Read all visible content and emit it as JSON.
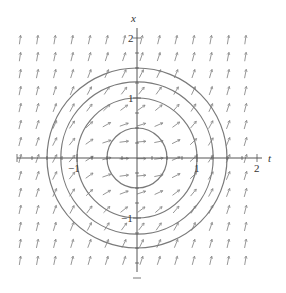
{
  "chart_data": {
    "type": "direction_field",
    "title": "",
    "equation_guess": "dx/dt = t^2 + x^2",
    "xlabel": "t",
    "ylabel": "x",
    "xlim": [
      -2,
      2
    ],
    "ylim": [
      -2,
      2
    ],
    "x_ticks": [
      -1,
      1,
      2
    ],
    "y_ticks": [
      2,
      1,
      -1
    ],
    "x_tick_labels": [
      "−1",
      "1",
      "2"
    ],
    "y_tick_labels": [
      "2",
      "1",
      "−1"
    ],
    "isoclines": [
      {
        "radius": 0.5,
        "label": "t^2 + x^2 = 0.25"
      },
      {
        "radius": 1.0,
        "label": "t^2 + x^2 = 1"
      },
      {
        "radius": 1.27,
        "label": "t^2 + x^2 ≈ 1.6"
      },
      {
        "radius": 1.5,
        "label": "t^2 + x^2 = 2.25"
      }
    ],
    "grid": false,
    "field_grid": {
      "t_start": -1.95,
      "t_step": 0.289,
      "t_count": 14,
      "x_start": 1.97,
      "x_step": -0.283,
      "x_count": 14
    },
    "colors": {
      "axis": "#555555",
      "curve": "#7a7a7a",
      "arrow": "#8a8a8a"
    }
  },
  "axes": {
    "t_label": "t",
    "x_label": "x"
  }
}
